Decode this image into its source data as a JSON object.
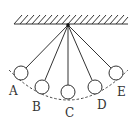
{
  "diagram": {
    "type": "pendulum",
    "pivot": {
      "x": 68,
      "y": 25
    },
    "ceiling": {
      "x1": 14,
      "x2": 128,
      "y": 24
    },
    "positions": [
      {
        "label": "A",
        "ball": {
          "x": 21,
          "y": 73
        },
        "label_pos": {
          "x": 9,
          "y": 95
        }
      },
      {
        "label": "B",
        "ball": {
          "x": 42,
          "y": 87
        },
        "label_pos": {
          "x": 32,
          "y": 111
        }
      },
      {
        "label": "C",
        "ball": {
          "x": 68,
          "y": 92
        },
        "label_pos": {
          "x": 65,
          "y": 117
        }
      },
      {
        "label": "D",
        "ball": {
          "x": 95,
          "y": 87
        },
        "label_pos": {
          "x": 97,
          "y": 109
        }
      },
      {
        "label": "E",
        "ball": {
          "x": 116,
          "y": 73
        },
        "label_pos": {
          "x": 117,
          "y": 96
        }
      }
    ],
    "ball_radius": 7,
    "colors": {
      "stroke": "#333333",
      "background": "#ffffff"
    }
  }
}
